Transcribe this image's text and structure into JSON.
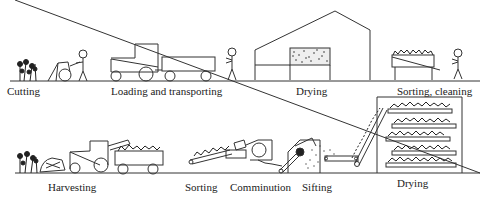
{
  "diagram": {
    "type": "process-comparison",
    "rows": [
      {
        "id": "traditional",
        "steps": [
          {
            "label": "Cutting",
            "icon": "plant-and-cutter-icon"
          },
          {
            "label": "Loading and transporting",
            "icon": "tractor-trailer-icon"
          },
          {
            "label": "Drying",
            "icon": "drying-barn-icon"
          },
          {
            "label": "Sorting, cleaning",
            "icon": "sorting-table-icon"
          }
        ]
      },
      {
        "id": "mechanized",
        "steps": [
          {
            "label": "Harvesting",
            "icon": "harvester-icon"
          },
          {
            "label": "Sorting",
            "icon": "conveyor-icon"
          },
          {
            "label": "Comminution",
            "icon": "chopper-icon"
          },
          {
            "label": "Sifting",
            "icon": "sifter-icon"
          },
          {
            "label": "Drying",
            "icon": "belt-dryer-icon"
          }
        ]
      }
    ],
    "colors": {
      "line": "#333333",
      "background": "#ffffff"
    }
  }
}
